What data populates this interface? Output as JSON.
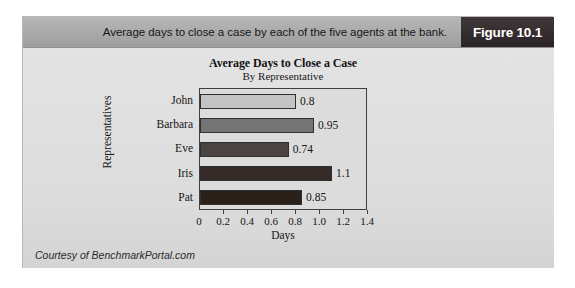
{
  "header": {
    "caption": "Average days to close a case by each of the five agents at the bank.",
    "figure_tag": "Figure 10.1"
  },
  "credit": "Courtesy of BenchmarkPortal.com",
  "chart_data": {
    "type": "bar",
    "orientation": "horizontal",
    "title": "Average Days to Close a Case",
    "subtitle": "By Representative",
    "xlabel": "Days",
    "ylabel": "Representatives",
    "categories": [
      "John",
      "Barbara",
      "Eve",
      "Iris",
      "Pat"
    ],
    "values": [
      0.8,
      0.95,
      0.74,
      1.1,
      0.85
    ],
    "value_labels": [
      "0.8",
      "0.95",
      "0.74",
      "1.1",
      "0.85"
    ],
    "bar_colors": [
      "#c3c3c3",
      "#747474",
      "#4b4341",
      "#342a27",
      "#2c2119"
    ],
    "xlim": [
      0,
      1.4
    ],
    "xticks": [
      0,
      0.2,
      0.4,
      0.6,
      0.8,
      1.0,
      1.2,
      1.4
    ],
    "xtick_labels": [
      "0",
      "0.2",
      "0.4",
      "0.6",
      "0.8",
      "1.0",
      "1.2",
      "1.4"
    ],
    "grid": false,
    "legend": false
  }
}
